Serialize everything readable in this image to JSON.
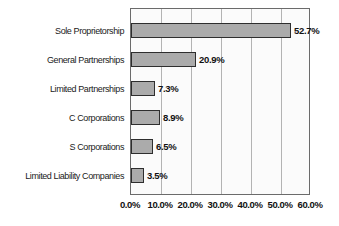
{
  "chart_data": {
    "type": "bar",
    "orientation": "horizontal",
    "title": "",
    "xlabel": "",
    "ylabel": "",
    "categories": [
      "Sole Proprietorship",
      "General Partnerships",
      "Limited Partnerships",
      "C Corporations",
      "S Corporations",
      "Limited Liability Companies"
    ],
    "values": [
      52.7,
      20.9,
      7.3,
      8.9,
      6.5,
      3.5
    ],
    "value_labels": [
      "52.7%",
      "20.9%",
      "7.3%",
      "8.9%",
      "6.5%",
      "3.5%"
    ],
    "x_ticks": [
      0,
      10,
      20,
      30,
      40,
      50,
      60
    ],
    "x_tick_labels": [
      "0.0%",
      "10.0%",
      "20.0%",
      "30.0%",
      "40.0%",
      "50.0%",
      "60.0%"
    ],
    "xlim": [
      0,
      60
    ],
    "grid": true,
    "legend": "none",
    "colors": {
      "bar_fill": "#ababab",
      "bar_border": "#2e2e2e",
      "plot_background": "#fbfbfb",
      "gridline": "#b3b3b3",
      "plot_border": "#6b6b6b",
      "text": "#111111"
    }
  }
}
